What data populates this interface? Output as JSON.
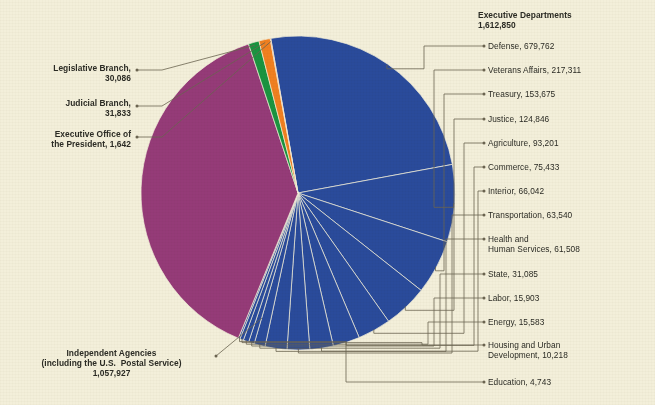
{
  "figure": {
    "background_color": "#f3efda",
    "text_color": "#2b2b24",
    "leader_color": "#6b6450"
  },
  "groups": {
    "executive_departments": {
      "title": "Executive Departments",
      "total": "1,612,850",
      "color": "#2a4b9b"
    },
    "independent_agencies": {
      "line1": "Independent Agencies",
      "line2": "(including the U.S.  Postal Service)",
      "line3": "1,057,927",
      "color": "#953b78"
    },
    "legislative_branch": {
      "line1": "Legislative Branch,",
      "line2": "30,086",
      "color": "#1a9440"
    },
    "judicial_branch": {
      "line1": "Judicial Branch,",
      "line2": "31,833",
      "color": "#f08020"
    },
    "executive_office": {
      "line1": "Executive Office of",
      "line2": "the President, 1,642",
      "color": "#e04a24"
    }
  },
  "right_labels": [
    {
      "text": "Defense, 679,762"
    },
    {
      "text": "Veterans Affairs, 217,311"
    },
    {
      "text": "Treasury, 153,675"
    },
    {
      "text": "Justice, 124,846"
    },
    {
      "text": "Agriculture, 93,201"
    },
    {
      "text": "Commerce, 75,433"
    },
    {
      "text": "Interior, 66,042"
    },
    {
      "text": "Transportation, 63,540"
    },
    {
      "text": "Health and\nHuman Services, 61,508"
    },
    {
      "text": "State, 31,085"
    },
    {
      "text": "Labor, 15,903"
    },
    {
      "text": "Energy, 15,583"
    },
    {
      "text": "Housing and Urban\nDevelopment, 10,218"
    },
    {
      "text": "Education, 4,743"
    }
  ],
  "chart_data": {
    "type": "pie",
    "units": "employees",
    "legend": "labels with leader lines",
    "total": 2704338,
    "center": {
      "x": 298,
      "y": 193
    },
    "radius": 157,
    "start_angle_deg": -100,
    "direction": "clockwise",
    "labels": [
      "Defense",
      "Veterans Affairs",
      "Treasury",
      "Justice",
      "Agriculture",
      "Commerce",
      "Interior",
      "Transportation",
      "Health and Human Services",
      "State",
      "Labor",
      "Energy",
      "Housing and Urban Development",
      "Education",
      "Independent Agencies (including the U.S. Postal Service)",
      "Legislative Branch",
      "Judicial Branch",
      "Executive Office of the President"
    ],
    "values": [
      679762,
      217311,
      153675,
      124846,
      93201,
      75433,
      66042,
      63540,
      61508,
      31085,
      15903,
      15583,
      10218,
      4743,
      1057927,
      30086,
      31833,
      1642
    ],
    "colors": [
      "#2a4b9b",
      "#2a4b9b",
      "#2a4b9b",
      "#2a4b9b",
      "#2a4b9b",
      "#2a4b9b",
      "#2a4b9b",
      "#2a4b9b",
      "#2a4b9b",
      "#2a4b9b",
      "#2a4b9b",
      "#2a4b9b",
      "#2a4b9b",
      "#2a4b9b",
      "#953b78",
      "#1a9440",
      "#f08020",
      "#e04a24"
    ],
    "group_of": [
      "Executive Departments",
      "Executive Departments",
      "Executive Departments",
      "Executive Departments",
      "Executive Departments",
      "Executive Departments",
      "Executive Departments",
      "Executive Departments",
      "Executive Departments",
      "Executive Departments",
      "Executive Departments",
      "Executive Departments",
      "Executive Departments",
      "Executive Departments",
      "Independent Agencies",
      "Legislative Branch",
      "Judicial Branch",
      "Executive Office of the President"
    ]
  }
}
